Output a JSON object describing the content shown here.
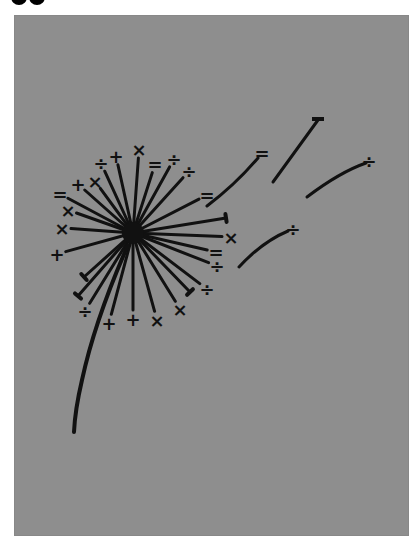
{
  "figure": {
    "title": "",
    "background_color": "#8e8e8e",
    "ink_color": "#111111",
    "page_color": "#ffffff",
    "top_fragment": "●●",
    "burst": {
      "center": [
        133,
        233
      ],
      "symbols": [
        {
          "glyph": "×",
          "x": 139,
          "y": 149
        },
        {
          "glyph": "+",
          "x": 116,
          "y": 156
        },
        {
          "glyph": "÷",
          "x": 101,
          "y": 163
        },
        {
          "glyph": "=",
          "x": 155,
          "y": 164
        },
        {
          "glyph": "÷",
          "x": 174,
          "y": 159
        },
        {
          "glyph": "÷",
          "x": 189,
          "y": 171
        },
        {
          "glyph": "+",
          "x": 78,
          "y": 184
        },
        {
          "glyph": "×",
          "x": 95,
          "y": 181
        },
        {
          "glyph": "=",
          "x": 60,
          "y": 194
        },
        {
          "glyph": "=",
          "x": 207,
          "y": 195
        },
        {
          "glyph": "×",
          "x": 68,
          "y": 210
        },
        {
          "glyph": "×",
          "x": 62,
          "y": 228
        },
        {
          "glyph": "+",
          "x": 57,
          "y": 254
        },
        {
          "glyph": "×",
          "x": 231,
          "y": 237
        },
        {
          "glyph": "=",
          "x": 216,
          "y": 252
        },
        {
          "glyph": "÷",
          "x": 217,
          "y": 266
        },
        {
          "glyph": "÷",
          "x": 207,
          "y": 289
        },
        {
          "glyph": "×",
          "x": 180,
          "y": 309
        },
        {
          "glyph": "×",
          "x": 157,
          "y": 320
        },
        {
          "glyph": "+",
          "x": 133,
          "y": 319
        },
        {
          "glyph": "+",
          "x": 109,
          "y": 323
        },
        {
          "glyph": "÷",
          "x": 85,
          "y": 311
        }
      ],
      "plain_ray_ends": [
        [
          226,
          218
        ],
        [
          78,
          296
        ],
        [
          84,
          277
        ],
        [
          190,
          292
        ]
      ]
    },
    "outliers": [
      {
        "glyph": "=",
        "x": 262,
        "y": 153
      },
      {
        "glyph": "÷",
        "x": 369,
        "y": 161
      },
      {
        "glyph": "÷",
        "x": 293,
        "y": 229
      },
      {
        "glyph": "-",
        "x": 318,
        "y": 119
      }
    ]
  }
}
